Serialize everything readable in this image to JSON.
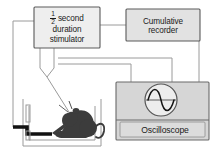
{
  "diagram": {
    "background_color": "#ffffff",
    "line_color": "#8a8a8a",
    "box_fill": "#e2e2e2",
    "box_stroke": "#5a5a5a",
    "text_color": "#1a1a1a",
    "animal_color": "#3a3a3a"
  },
  "stimulator": {
    "fraction_numerator": "1",
    "fraction_denominator": "2",
    "line1_word": "second",
    "line2": "duration",
    "line3": "stimulator"
  },
  "recorder": {
    "line1": "Cumulative",
    "line2": "recorder"
  },
  "oscilloscope": {
    "label": "Oscilloscope",
    "screen_trace": "sine-wave"
  },
  "chamber": {
    "lever_name": "lever",
    "subject": "rat"
  }
}
